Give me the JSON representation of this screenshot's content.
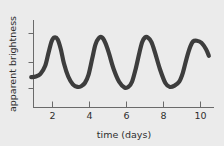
{
  "chart_data": {
    "type": "line",
    "title": "",
    "xlabel": "time (days)",
    "ylabel": "apparent brightness",
    "xlim": [
      0.8,
      10.6
    ],
    "ylim": [
      0,
      1
    ],
    "grid": false,
    "legend": null,
    "x_ticks": [
      "2",
      "4",
      "6",
      "8",
      "10"
    ],
    "x_tick_values": [
      2,
      4,
      6,
      8,
      10
    ],
    "y_ticks": [
      "",
      "",
      ""
    ],
    "y_tick_values": [
      0.82,
      0.47,
      0.16
    ],
    "series": [
      {
        "name": "light curve",
        "color": "#3d3d3d",
        "x": [
          0.85,
          1.1,
          1.35,
          1.6,
          1.78,
          1.95,
          2.1,
          2.28,
          2.45,
          2.62,
          2.85,
          3.1,
          3.35,
          3.55,
          3.75,
          3.95,
          4.15,
          4.32,
          4.5,
          4.68,
          4.85,
          5.05,
          5.3,
          5.6,
          5.9,
          6.1,
          6.3,
          6.5,
          6.7,
          6.85,
          7.0,
          7.15,
          7.35,
          7.55,
          7.8,
          8.1,
          8.35,
          8.6,
          8.85,
          9.05,
          9.25,
          9.45,
          9.6,
          9.8,
          10.05,
          10.3,
          10.45
        ],
        "y": [
          0.29,
          0.3,
          0.34,
          0.46,
          0.66,
          0.84,
          0.9,
          0.87,
          0.72,
          0.5,
          0.3,
          0.18,
          0.14,
          0.15,
          0.2,
          0.33,
          0.58,
          0.79,
          0.89,
          0.9,
          0.82,
          0.66,
          0.42,
          0.22,
          0.13,
          0.14,
          0.22,
          0.42,
          0.67,
          0.83,
          0.9,
          0.9,
          0.83,
          0.66,
          0.42,
          0.2,
          0.14,
          0.16,
          0.22,
          0.36,
          0.58,
          0.76,
          0.84,
          0.85,
          0.82,
          0.72,
          0.62
        ]
      }
    ]
  },
  "axes": {
    "x_axis_label": "time (days)",
    "y_axis_label": "apparent brightness"
  },
  "figure": {
    "background_color": "#ebebeb",
    "curve_color": "#3d3d3d",
    "axis_color": "#6a6a6a"
  }
}
